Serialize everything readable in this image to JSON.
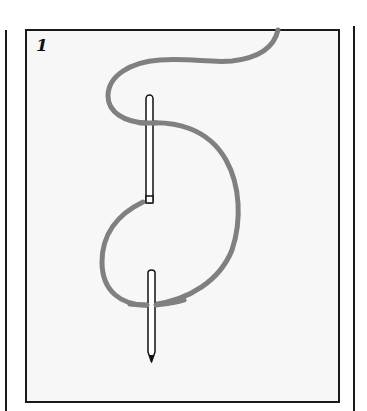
{
  "diagram": {
    "step_number": "1",
    "colors": {
      "frame": "#1a1a1a",
      "panel_background": "#f7f7f7",
      "thread": "#808080",
      "needle_outline": "#111111",
      "needle_fill": "#ffffff"
    }
  }
}
